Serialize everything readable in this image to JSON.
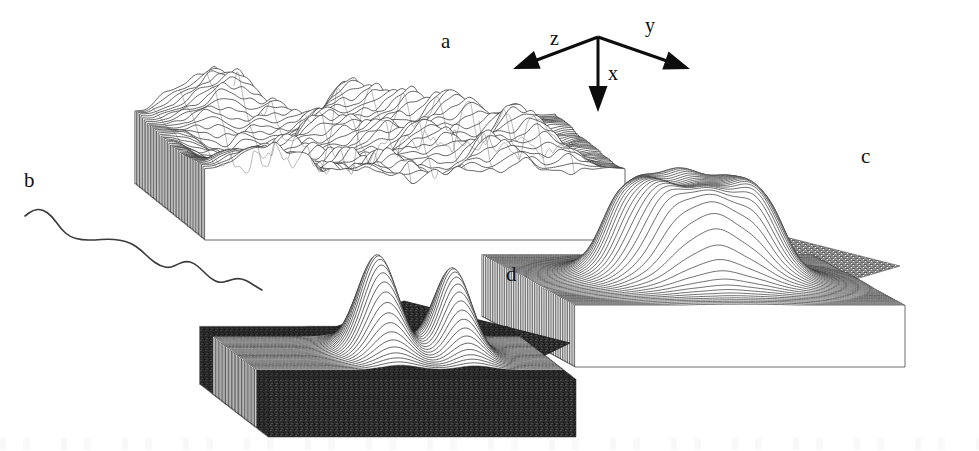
{
  "figure": {
    "width": 979,
    "height": 451,
    "background": "#ffffff",
    "ink_color": "#121212"
  },
  "panel_labels": [
    {
      "key": "a",
      "text": "a",
      "x": 441,
      "y": 31
    },
    {
      "key": "b",
      "text": "b",
      "x": 24,
      "y": 170
    },
    {
      "key": "c",
      "text": "c",
      "x": 861,
      "y": 146
    },
    {
      "key": "d",
      "text": "d",
      "x": 506,
      "y": 264
    }
  ],
  "axes_indicator": {
    "name": "coordinate-axes",
    "origin": {
      "x": 598,
      "y": 37
    },
    "stroke": "#0d0d0d",
    "stroke_width": 3,
    "arrows": [
      {
        "label": "z",
        "tip_x": 513,
        "tip_y": 69,
        "label_x": 550,
        "label_y": 45
      },
      {
        "label": "y",
        "tip_x": 690,
        "tip_y": 69,
        "label_x": 645,
        "label_y": 32
      },
      {
        "label": "x",
        "tip_x": 598,
        "tip_y": 112,
        "label_x": 608,
        "label_y": 80
      }
    ]
  },
  "panels": {
    "a": {
      "label": "a",
      "type": "surface-mesh",
      "title": "rough random surface",
      "bounds": {
        "x": 205,
        "y": 58,
        "width": 420,
        "height": 170
      },
      "surface_kind": "multiscale-random-roughness",
      "mesh_lines": 46,
      "baseplane": false,
      "roughness": 1.0
    },
    "b": {
      "label": "b",
      "type": "profile-line",
      "title": "single surface profile trace",
      "bounds": {
        "x": 22,
        "y": 200,
        "width": 240,
        "height": 95
      },
      "stroke": "#3a3a3a",
      "stroke_width": 1.6,
      "profile_points": [
        [
          25,
          216
        ],
        [
          33,
          210
        ],
        [
          42,
          209
        ],
        [
          52,
          216
        ],
        [
          61,
          229
        ],
        [
          70,
          237
        ],
        [
          82,
          240
        ],
        [
          95,
          240
        ],
        [
          108,
          239
        ],
        [
          120,
          240
        ],
        [
          131,
          243
        ],
        [
          141,
          250
        ],
        [
          150,
          259
        ],
        [
          160,
          266
        ],
        [
          170,
          268
        ],
        [
          178,
          264
        ],
        [
          186,
          261
        ],
        [
          194,
          263
        ],
        [
          202,
          270
        ],
        [
          210,
          278
        ],
        [
          219,
          283
        ],
        [
          228,
          281
        ],
        [
          237,
          278
        ],
        [
          246,
          280
        ],
        [
          255,
          286
        ],
        [
          262,
          290
        ]
      ]
    },
    "c": {
      "label": "c",
      "type": "surface-mesh",
      "title": "flat-topped plateau / mesa on textured base plane",
      "bounds": {
        "x": 565,
        "y": 150,
        "width": 340,
        "height": 175
      },
      "baseplane": true,
      "baseplane_shade": "#6e6e6e",
      "plateau": {
        "center_x": 740,
        "top_y": 165,
        "flat_top": true,
        "crater_rim": true,
        "radius_x": 98,
        "height": 105
      },
      "mesh_lines": 54
    },
    "d": {
      "label": "d",
      "type": "surface-mesh",
      "title": "two sharp gaussian peaks on dark base plane",
      "bounds": {
        "x": 262,
        "y": 280,
        "width": 310,
        "height": 135
      },
      "baseplane": true,
      "baseplane_shade": "#2e2e2e",
      "peaks": [
        {
          "center_x": 412,
          "apex_y": 287,
          "half_width": 30,
          "height": 98
        },
        {
          "center_x": 487,
          "apex_y": 303,
          "half_width": 27,
          "height": 85
        }
      ],
      "mesh_lines": 48
    }
  }
}
